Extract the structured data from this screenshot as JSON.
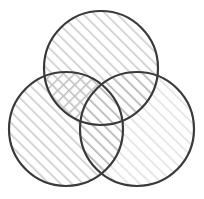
{
  "figure": {
    "type": "venn-diagram",
    "canvas": {
      "width": 204,
      "height": 199,
      "background": "#ffffff"
    },
    "stroke": {
      "color": "#3a3a3a",
      "width": 2.2
    },
    "hatch": {
      "line_color": "#c9c9c9",
      "line_color_light": "#dedede",
      "line_color_dark": "#b4b4b4",
      "spacing": 8,
      "angle_deg": 45,
      "cross_angle_deg": -45
    },
    "circles": [
      {
        "id": "top",
        "label": "Set A",
        "cx": 101,
        "cy": 68,
        "r": 57,
        "fill_pattern": "diagonal-hatch"
      },
      {
        "id": "left",
        "label": "Set B",
        "cx": 66,
        "cy": 129,
        "r": 57,
        "fill_pattern": "diagonal-hatch"
      },
      {
        "id": "right",
        "label": "Set C",
        "cx": 137,
        "cy": 129,
        "r": 57,
        "fill_pattern": "diagonal-hatch-light"
      }
    ],
    "regions": [
      {
        "id": "top-left-overlap",
        "label": "A ∩ B",
        "fill_pattern": "cross-hatch"
      },
      {
        "id": "top-right-overlap",
        "label": "A ∩ C",
        "fill_pattern": "diagonal-hatch-dark"
      },
      {
        "id": "bottom-overlap",
        "label": "B ∩ C",
        "fill_pattern": "diagonal-hatch-dark"
      },
      {
        "id": "center-overlap",
        "label": "A ∩ B ∩ C",
        "fill_pattern": "diagonal-hatch-dark"
      }
    ]
  }
}
